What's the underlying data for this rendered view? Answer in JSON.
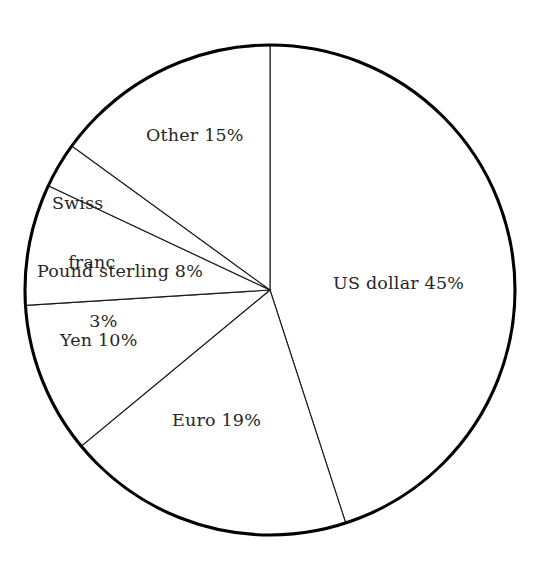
{
  "chart_data": {
    "type": "pie",
    "title": "",
    "subtitle": "",
    "xlabel": "",
    "ylabel": "",
    "legend_position": "none",
    "grid": false,
    "units": "percent",
    "total": 100,
    "start_angle_deg": 0,
    "direction": "clockwise",
    "categories": [
      "US dollar",
      "Euro",
      "Yen",
      "Pound sterling",
      "Swiss franc",
      "Other"
    ],
    "values": [
      45,
      19,
      10,
      8,
      3,
      15
    ],
    "slices": [
      {
        "name": "us-dollar",
        "label": "US dollar 45%",
        "category": "US dollar",
        "value": 45,
        "value_text": "45%",
        "start_angle_deg": 0,
        "end_angle_deg": 162,
        "color": "#ffffff",
        "stroke": "#1a1a1a"
      },
      {
        "name": "euro",
        "label": "Euro 19%",
        "category": "Euro",
        "value": 19,
        "value_text": "19%",
        "start_angle_deg": 162,
        "end_angle_deg": 230.4,
        "color": "#ffffff",
        "stroke": "#1a1a1a"
      },
      {
        "name": "yen",
        "label": "Yen 10%",
        "category": "Yen",
        "value": 10,
        "value_text": "10%",
        "start_angle_deg": 230.4,
        "end_angle_deg": 266.4,
        "color": "#ffffff",
        "stroke": "#1a1a1a"
      },
      {
        "name": "pound-sterling",
        "label": "Pound sterling 8%",
        "category": "Pound sterling",
        "value": 8,
        "value_text": "8%",
        "start_angle_deg": 266.4,
        "end_angle_deg": 295.2,
        "color": "#ffffff",
        "stroke": "#1a1a1a"
      },
      {
        "name": "swiss-franc",
        "label": "Swiss franc 3%",
        "category": "Swiss franc",
        "value": 3,
        "value_text": "3%",
        "start_angle_deg": 295.2,
        "end_angle_deg": 306,
        "color": "#ffffff",
        "stroke": "#1a1a1a",
        "label_lines": [
          "Swiss",
          "franc",
          "3%"
        ]
      },
      {
        "name": "other",
        "label": "Other 15%",
        "category": "Other",
        "value": 15,
        "value_text": "15%",
        "start_angle_deg": 306,
        "end_angle_deg": 360,
        "color": "#ffffff",
        "stroke": "#1a1a1a"
      }
    ]
  },
  "labels": {
    "us_dollar": "US dollar 45%",
    "euro": "Euro 19%",
    "yen": "Yen 10%",
    "pound_sterling": "Pound sterling 8%",
    "swiss_franc_line1": "Swiss",
    "swiss_franc_line2": "franc",
    "swiss_franc_line3": "3%",
    "other": "Other 15%"
  },
  "style": {
    "background": "#ffffff",
    "outline_color": "#000000",
    "divider_color": "#1a1a1a",
    "text_color": "#262626"
  },
  "geometry": {
    "center_x": 270,
    "center_y": 290,
    "radius": 245
  }
}
